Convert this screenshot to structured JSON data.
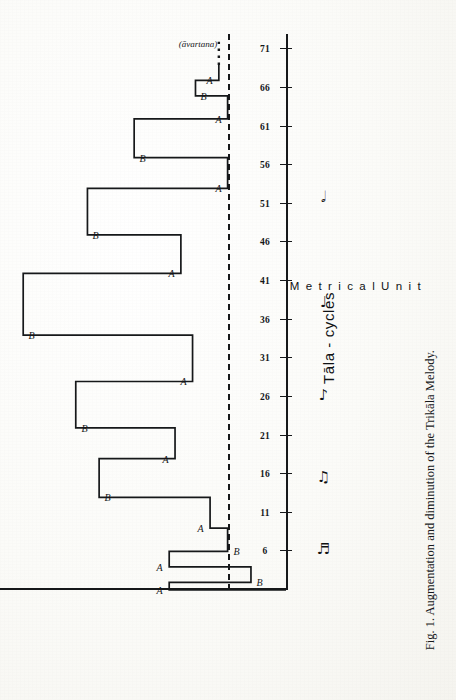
{
  "figure": {
    "caption": "Fig. 1. Augmentation and diminution of the Trikāla Melody.",
    "y_axis_title": "Tāla - cycles",
    "x_axis_title": "M e t r i c a l   U n i t",
    "annotation_paren": "(āvartana)",
    "note_values": [
      {
        "name": "sixteenth-note-pair-glyph",
        "glyph": "♬"
      },
      {
        "name": "eighth-note-pair-glyph",
        "glyph": "♫"
      },
      {
        "name": "eighth-note-glyph",
        "glyph": "♪"
      },
      {
        "name": "quarter-note-glyph",
        "glyph": "♩"
      },
      {
        "name": "half-note-glyph",
        "glyph": "𝅗𝅥"
      }
    ]
  },
  "chart_data": {
    "type": "line",
    "title": "Augmentation and diminution of the Trikāla Melody",
    "xlabel": "Tāla - cycles",
    "ylabel": "Metrical Unit",
    "xlim": [
      1,
      73
    ],
    "ylim": [
      0,
      5
    ],
    "grid": false,
    "legend": "none",
    "tick_labels": [
      "6",
      "11",
      "16",
      "21",
      "26",
      "31",
      "36",
      "41",
      "46",
      "51",
      "56",
      "61",
      "66",
      "71"
    ],
    "tick_values": [
      6,
      11,
      16,
      21,
      26,
      31,
      36,
      41,
      46,
      51,
      56,
      61,
      66,
      71
    ],
    "reference_line": {
      "style": "dashed",
      "level": 1.0,
      "label": "baseline metrical unit"
    },
    "segments": [
      {
        "label": "A",
        "start_cycle": 1,
        "end_cycle": 2,
        "level": 2.0
      },
      {
        "label": "B",
        "start_cycle": 2,
        "end_cycle": 4,
        "level": 0.6
      },
      {
        "label": "A",
        "start_cycle": 4,
        "end_cycle": 6,
        "level": 2.0
      },
      {
        "label": "B",
        "start_cycle": 6,
        "end_cycle": 9,
        "level": 1.0
      },
      {
        "label": "A",
        "start_cycle": 9,
        "end_cycle": 13,
        "level": 1.3
      },
      {
        "label": "B",
        "start_cycle": 13,
        "end_cycle": 18,
        "level": 3.2
      },
      {
        "label": "A",
        "start_cycle": 18,
        "end_cycle": 22,
        "level": 1.9
      },
      {
        "label": "B",
        "start_cycle": 22,
        "end_cycle": 28,
        "level": 3.6
      },
      {
        "label": "A",
        "start_cycle": 28,
        "end_cycle": 34,
        "level": 1.6
      },
      {
        "label": "B",
        "start_cycle": 34,
        "end_cycle": 42,
        "level": 4.5
      },
      {
        "label": "A",
        "start_cycle": 42,
        "end_cycle": 47,
        "level": 1.8
      },
      {
        "label": "B",
        "start_cycle": 47,
        "end_cycle": 53,
        "level": 3.4
      },
      {
        "label": "A",
        "start_cycle": 53,
        "end_cycle": 57,
        "level": 1.0
      },
      {
        "label": "B",
        "start_cycle": 57,
        "end_cycle": 62,
        "level": 2.6
      },
      {
        "label": "A",
        "start_cycle": 62,
        "end_cycle": 65,
        "level": 1.0
      },
      {
        "label": "B",
        "start_cycle": 65,
        "end_cycle": 67,
        "level": 1.55
      },
      {
        "label": "A",
        "start_cycle": 67,
        "end_cycle": 69,
        "level": 1.15
      }
    ],
    "series_labels": [
      "A",
      "B",
      "A",
      "B",
      "A",
      "B",
      "A",
      "B",
      "A",
      "B",
      "A",
      "B",
      "A",
      "B",
      "A",
      "B",
      "A"
    ],
    "annotations": [
      {
        "text": "(āvartana)",
        "near_cycle": 70,
        "level": 1.6
      }
    ],
    "tail": {
      "style": "dotted",
      "from_cycle": 69,
      "to_cycle": 72,
      "level": 1.15
    }
  }
}
